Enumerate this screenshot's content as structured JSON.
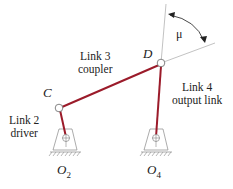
{
  "diagram": {
    "colors": {
      "link": "#9b1b2a",
      "line": "#888888",
      "text": "#222222"
    },
    "points": {
      "C": "C",
      "D": "D",
      "O2": "O",
      "O2_sub": "2",
      "O4": "O",
      "O4_sub": "4"
    },
    "angle_label": "μ",
    "links": {
      "link2": {
        "name": "Link 2",
        "role": "driver"
      },
      "link3": {
        "name": "Link 3",
        "role": "coupler"
      },
      "link4": {
        "name": "Link 4",
        "role": "output link"
      }
    }
  }
}
